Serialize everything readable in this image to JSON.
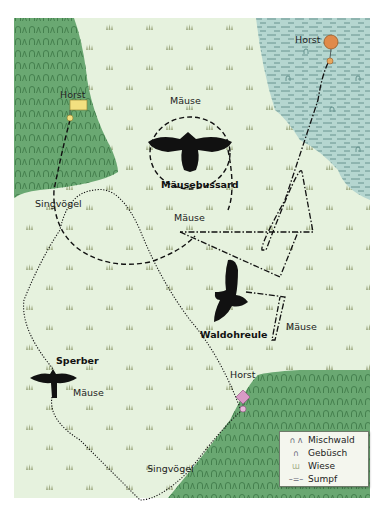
{
  "map": {
    "colors": {
      "meadow": "#e6f2de",
      "forest": "#6aa872",
      "swamp": "#b5d6d0",
      "grass_symbol": "#9aa77d",
      "horst_mausebussard": "#f3e080",
      "horst_waldohreule": "#e08a4a",
      "horst_sperber": "#d99ac6",
      "bird": "#111111"
    },
    "birds": [
      {
        "name": "Mäusebussard",
        "prey": [
          "Mäuse"
        ],
        "nest_label": "Horst",
        "nest_symbol": "yellow-rectangle",
        "path_style": "dashed"
      },
      {
        "name": "Waldohreule",
        "prey": [
          "Mäuse",
          "Mäuse"
        ],
        "nest_label": "Horst",
        "nest_symbol": "orange-circle",
        "path_style": "dash-dot"
      },
      {
        "name": "Sperber",
        "prey": [
          "Mäuse",
          "Singvögel",
          "Singvögel"
        ],
        "nest_label": "Horst",
        "nest_symbol": "pink-diamond",
        "path_style": "dotted"
      }
    ],
    "labels": {
      "horst_top_left": "Horst",
      "horst_top_right": "Horst",
      "horst_bottom_right": "Horst",
      "mause_top": "Mäuse",
      "mausebussard": "Mäusebussard",
      "singvogel_left": "Singvögel",
      "mause_middle": "Mäuse",
      "waldohreule": "Waldohreule",
      "mause_right": "Mäuse",
      "sperber": "Sperber",
      "mause_bottom": "Mäuse",
      "singvogel_bottom": "Singvögel"
    },
    "legend": {
      "items": [
        {
          "symbol": "forest-symbol",
          "glyph": "∩ ʌ",
          "label": "Mischwald"
        },
        {
          "symbol": "bush-symbol",
          "glyph": "∩",
          "label": "Gebüsch"
        },
        {
          "symbol": "grass-symbol",
          "glyph": "ɯ",
          "label": "Wiese"
        },
        {
          "symbol": "swamp-symbol",
          "glyph": "–=–",
          "label": "Sumpf"
        }
      ]
    }
  }
}
